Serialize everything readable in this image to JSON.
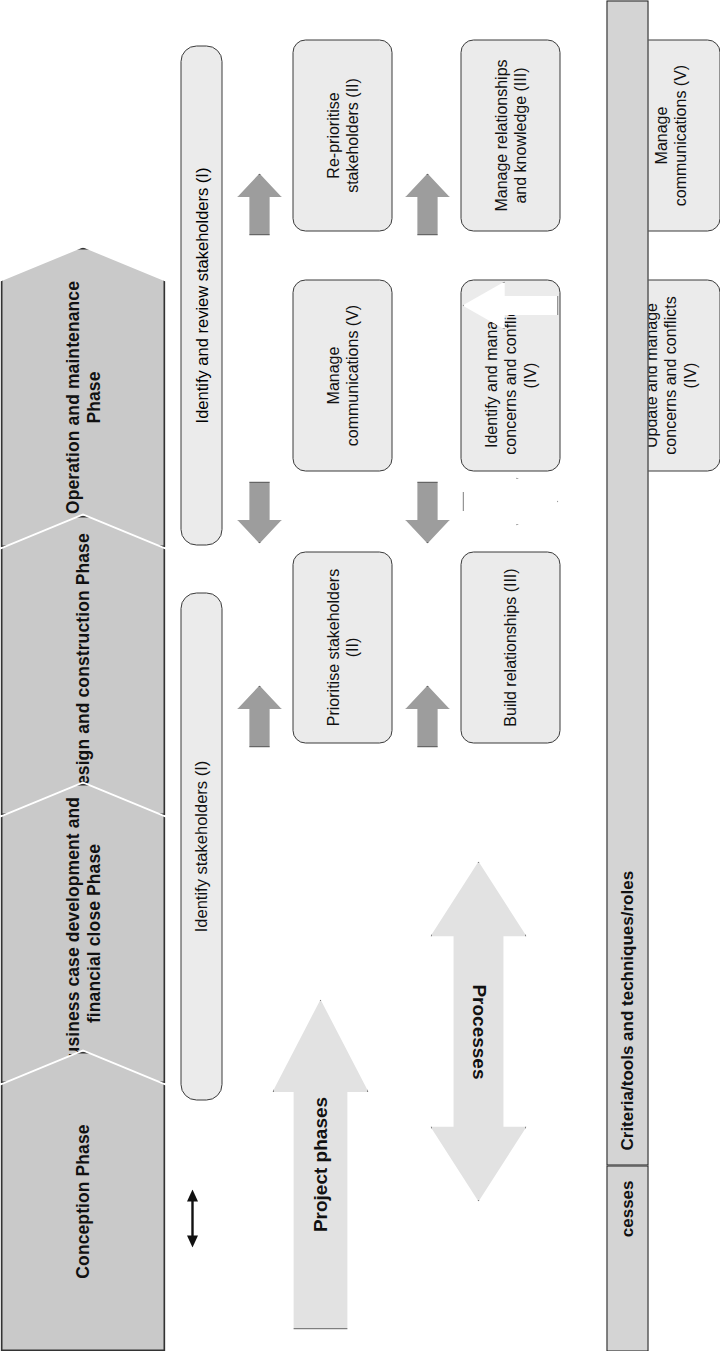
{
  "diagram": {
    "title_hidden": "",
    "phases": [
      {
        "id": "phase-conception",
        "label": "Conception Phase"
      },
      {
        "id": "phase-business-case",
        "label": "Business case development and financial close Phase"
      },
      {
        "id": "phase-design-construction",
        "label": "Design and construction Phase"
      },
      {
        "id": "phase-operation-maintenance",
        "label": "Operation and maintenance Phase"
      }
    ],
    "stage_one": {
      "spine": "Identify stakeholders (I)",
      "steps": [
        {
          "id": "prioritise-stakeholders",
          "label": "Prioritise stakeholders (II)"
        },
        {
          "id": "build-relationships",
          "label": "Build relationships (III)"
        },
        {
          "id": "identify-manage-concerns",
          "label": "Identify and manage concerns and conflicts (IV)"
        },
        {
          "id": "manage-communications",
          "label": "Manage communications (V)"
        }
      ]
    },
    "stage_two": {
      "spine": "Identify and review stakeholders (I)",
      "steps": [
        {
          "id": "re-prioritise-stakeholders",
          "label": "Re-prioritise stakeholders (II)"
        },
        {
          "id": "manage-relationships-knowledge",
          "label": "Manage relationships and knowledge (III)"
        },
        {
          "id": "update-manage-concerns",
          "label": "Update and manage concerns and conflicts (IV)"
        },
        {
          "id": "manage-communications-2",
          "label": "Manage communications (V)"
        }
      ]
    },
    "legend": {
      "project_phases": "Project phases",
      "processes": "Processes"
    },
    "table": {
      "row_label": "cesses",
      "header_label": "Criteria/tools and techniques/roles"
    },
    "colors": {
      "phase_fill": "#c9c9c9",
      "box_fill": "#ebebeb",
      "solid_arrow": "#9d9d9d",
      "hollow_arrow": "#ffffff",
      "legend_fill": "#e2e2e2",
      "table_fill": "#d4d4d4",
      "stroke": "#333333"
    }
  }
}
